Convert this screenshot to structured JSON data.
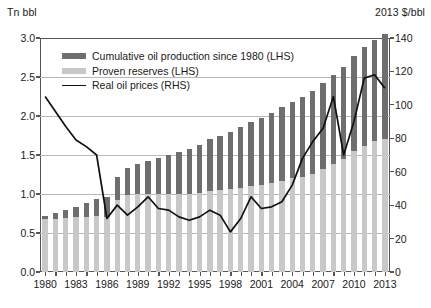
{
  "chart_data": {
    "type": "bar",
    "title": "",
    "subtitle": "",
    "xlabel": "",
    "ylabel": "Tn bbl",
    "ylabel_right": "2013 $/bbl",
    "ylim": [
      0,
      3.0
    ],
    "ylim_right": [
      0,
      140
    ],
    "yticks": [
      "0.0",
      "0.5",
      "1.0",
      "1.5",
      "2.0",
      "2.5",
      "3.0"
    ],
    "yticks_right": [
      "0",
      "20",
      "40",
      "60",
      "80",
      "100",
      "120",
      "140"
    ],
    "grid": true,
    "legend_position": "top-left",
    "legend": [
      "Cumulative oil production since 1980 (LHS)",
      "Proven reserves (LHS)",
      "Real oil prices (RHS)"
    ],
    "x": [
      1980,
      1981,
      1982,
      1983,
      1984,
      1985,
      1986,
      1987,
      1988,
      1989,
      1990,
      1991,
      1992,
      1993,
      1994,
      1995,
      1996,
      1997,
      1998,
      1999,
      2000,
      2001,
      2002,
      2003,
      2004,
      2005,
      2006,
      2007,
      2008,
      2009,
      2010,
      2011,
      2012,
      2013
    ],
    "xtick_labels": [
      "1980",
      "1983",
      "1986",
      "1989",
      "1992",
      "1995",
      "1998",
      "2001",
      "2004",
      "2007",
      "2010",
      "2013"
    ],
    "xtick_years": [
      1980,
      1983,
      1986,
      1989,
      1992,
      1995,
      1998,
      2001,
      2004,
      2007,
      2010,
      2013
    ],
    "series": [
      {
        "name": "Proven reserves (LHS)",
        "type": "bar-stacked-bottom",
        "color": "#c8c8c8",
        "axis": "left",
        "values": [
          0.68,
          0.68,
          0.69,
          0.7,
          0.71,
          0.72,
          0.7,
          0.92,
          0.99,
          1.0,
          1.0,
          1.0,
          1.0,
          1.0,
          1.0,
          1.01,
          1.04,
          1.05,
          1.06,
          1.08,
          1.1,
          1.12,
          1.14,
          1.17,
          1.2,
          1.22,
          1.26,
          1.32,
          1.38,
          1.45,
          1.55,
          1.62,
          1.68,
          1.71
        ]
      },
      {
        "name": "Cumulative oil production since 1980 (LHS)",
        "type": "bar-stacked-top",
        "color": "#6e6e6e",
        "axis": "left",
        "values": [
          0.04,
          0.08,
          0.11,
          0.14,
          0.18,
          0.22,
          0.26,
          0.3,
          0.34,
          0.38,
          0.42,
          0.46,
          0.5,
          0.54,
          0.58,
          0.62,
          0.66,
          0.7,
          0.74,
          0.78,
          0.82,
          0.86,
          0.9,
          0.94,
          0.98,
          1.02,
          1.06,
          1.1,
          1.14,
          1.18,
          1.22,
          1.26,
          1.3,
          1.34
        ]
      },
      {
        "name": "Real oil prices (RHS)",
        "type": "line",
        "color": "#111111",
        "axis": "right",
        "values": [
          105,
          96,
          87,
          79,
          75,
          70,
          32,
          40,
          34,
          39,
          45,
          38,
          37,
          33,
          31,
          33,
          37,
          34,
          24,
          32,
          45,
          38,
          39,
          42,
          52,
          68,
          78,
          86,
          105,
          70,
          90,
          116,
          118,
          110
        ]
      }
    ]
  }
}
